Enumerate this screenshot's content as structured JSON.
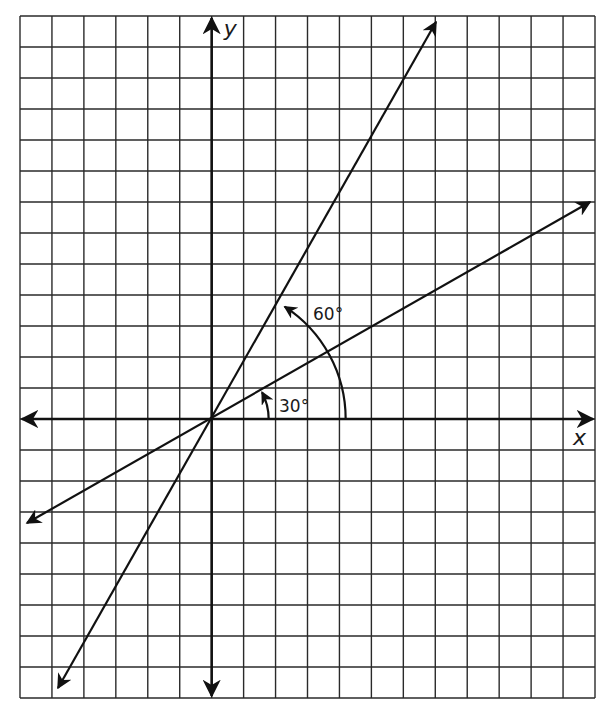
{
  "diagram": {
    "title": "",
    "grid": {
      "left": 20,
      "top": 16,
      "right": 595,
      "bottom": 698,
      "cols": 18,
      "rows": 22,
      "origin_col": 6,
      "origin_row": 13,
      "line_color": "#2a2a2a",
      "axis_color": "#111111"
    },
    "axes": {
      "x_label": "x",
      "y_label": "y"
    },
    "lines": [
      {
        "name": "line-30-degrees",
        "angle_deg": 30
      },
      {
        "name": "line-60-degrees",
        "angle_deg": 60
      }
    ],
    "angle_markers": [
      {
        "name": "angle-30",
        "label": "30°",
        "degrees": 30,
        "radius_units": 1.85
      },
      {
        "name": "angle-60",
        "label": "60°",
        "degrees": 60,
        "radius_units": 4.2
      }
    ]
  }
}
